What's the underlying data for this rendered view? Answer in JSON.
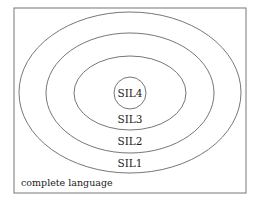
{
  "diagram": {
    "frame_label": "complete language",
    "levels": [
      {
        "label": "SIL1"
      },
      {
        "label": "SIL2"
      },
      {
        "label": "SIL3"
      },
      {
        "label": "SIL4"
      }
    ],
    "stroke_color": "#666666"
  }
}
